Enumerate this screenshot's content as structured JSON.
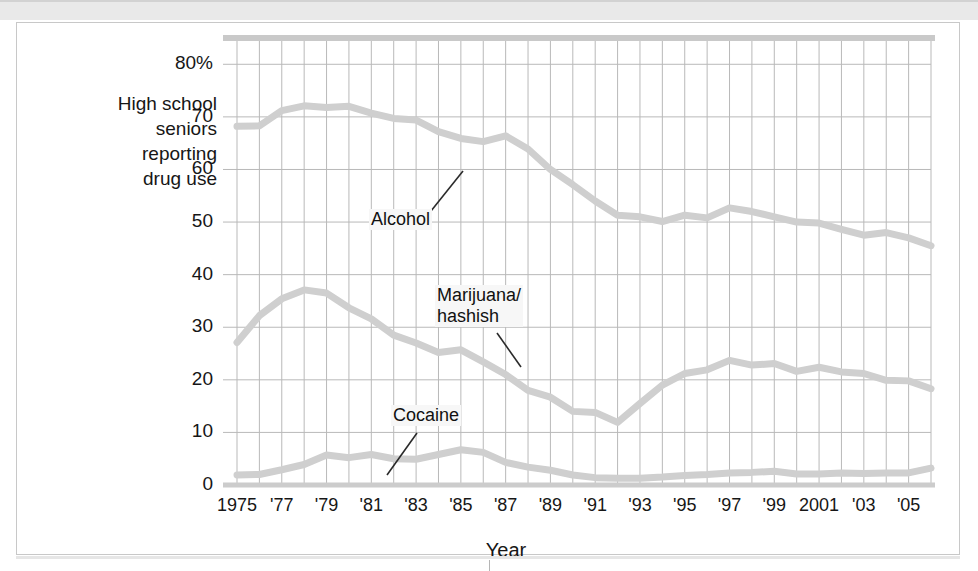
{
  "figure": {
    "y_axis_caption": "High school\nseniors\nreporting\ndrug use",
    "x_axis_title": "Year"
  },
  "chart_data": {
    "type": "line",
    "title": "",
    "subtitle": "",
    "xlabel": "Year",
    "ylabel": "High school seniors reporting drug use",
    "xlim": [
      1975,
      2006
    ],
    "ylim": [
      0,
      85
    ],
    "grid": true,
    "legend_position": "inline-annotations",
    "y_ticks": [
      0,
      10,
      20,
      30,
      40,
      50,
      60,
      70,
      80
    ],
    "y_tick_labels": [
      "0",
      "10",
      "20",
      "30",
      "40",
      "50",
      "60",
      "70",
      "80%"
    ],
    "x_ticks": [
      1975,
      1977,
      1979,
      1981,
      1983,
      1985,
      1987,
      1989,
      1991,
      1993,
      1995,
      1997,
      1999,
      2001,
      2003,
      2005
    ],
    "x_tick_labels": [
      "1975",
      "'77",
      "'79",
      "'81",
      "'83",
      "'85",
      "'87",
      "'89",
      "'91",
      "'93",
      "'95",
      "'97",
      "'99",
      "2001",
      "'03",
      "'05"
    ],
    "x_gridline_years": [
      1975,
      1976,
      1977,
      1978,
      1979,
      1980,
      1981,
      1982,
      1983,
      1984,
      1985,
      1986,
      1987,
      1988,
      1989,
      1990,
      1991,
      1992,
      1993,
      1994,
      1995,
      1996,
      1997,
      1998,
      1999,
      2000,
      2001,
      2002,
      2003,
      2004,
      2005,
      2006
    ],
    "line_color": "#cfcfcf",
    "gridline_color": "#b9b9b9",
    "border_color": "#c0c0c0",
    "x": [
      1975,
      1976,
      1977,
      1978,
      1979,
      1980,
      1981,
      1982,
      1983,
      1984,
      1985,
      1986,
      1987,
      1988,
      1989,
      1990,
      1991,
      1992,
      1993,
      1994,
      1995,
      1996,
      1997,
      1998,
      1999,
      2000,
      2001,
      2002,
      2003,
      2004,
      2005,
      2006
    ],
    "series": [
      {
        "name": "Alcohol",
        "annotation": "Alcohol",
        "values": [
          68.2,
          68.3,
          71.2,
          72.1,
          71.8,
          72.0,
          70.7,
          69.7,
          69.4,
          67.2,
          65.9,
          65.3,
          66.4,
          63.9,
          60.0,
          57.1,
          54.0,
          51.3,
          51.0,
          50.1,
          51.3,
          50.8,
          52.7,
          52.0,
          51.0,
          50.0,
          49.8,
          48.6,
          47.5,
          48.0,
          47.0,
          45.5
        ]
      },
      {
        "name": "Marijuana/hashish",
        "annotation": "Marijuana/\nhashish",
        "values": [
          27.1,
          32.2,
          35.4,
          37.1,
          36.5,
          33.7,
          31.6,
          28.5,
          27.0,
          25.2,
          25.7,
          23.4,
          21.0,
          18.0,
          16.7,
          14.0,
          13.8,
          11.9,
          15.5,
          19.0,
          21.2,
          21.9,
          23.7,
          22.8,
          23.1,
          21.6,
          22.4,
          21.5,
          21.2,
          19.9,
          19.8,
          18.3
        ]
      },
      {
        "name": "Cocaine",
        "annotation": "Cocaine",
        "values": [
          1.9,
          2.0,
          2.9,
          3.9,
          5.7,
          5.2,
          5.8,
          5.0,
          4.9,
          5.8,
          6.7,
          6.2,
          4.3,
          3.4,
          2.8,
          1.9,
          1.4,
          1.3,
          1.3,
          1.5,
          1.8,
          2.0,
          2.3,
          2.4,
          2.6,
          2.1,
          2.1,
          2.3,
          2.2,
          2.3,
          2.3,
          3.2
        ]
      }
    ],
    "annotations": [
      {
        "label": "Alcohol",
        "leader": "points up-right to alcohol line near 1985"
      },
      {
        "label": "Marijuana/hashish",
        "leader": "points down-right to marijuana line near 1986"
      },
      {
        "label": "Cocaine",
        "leader": "points down-left to cocaine line near 1982"
      }
    ]
  }
}
